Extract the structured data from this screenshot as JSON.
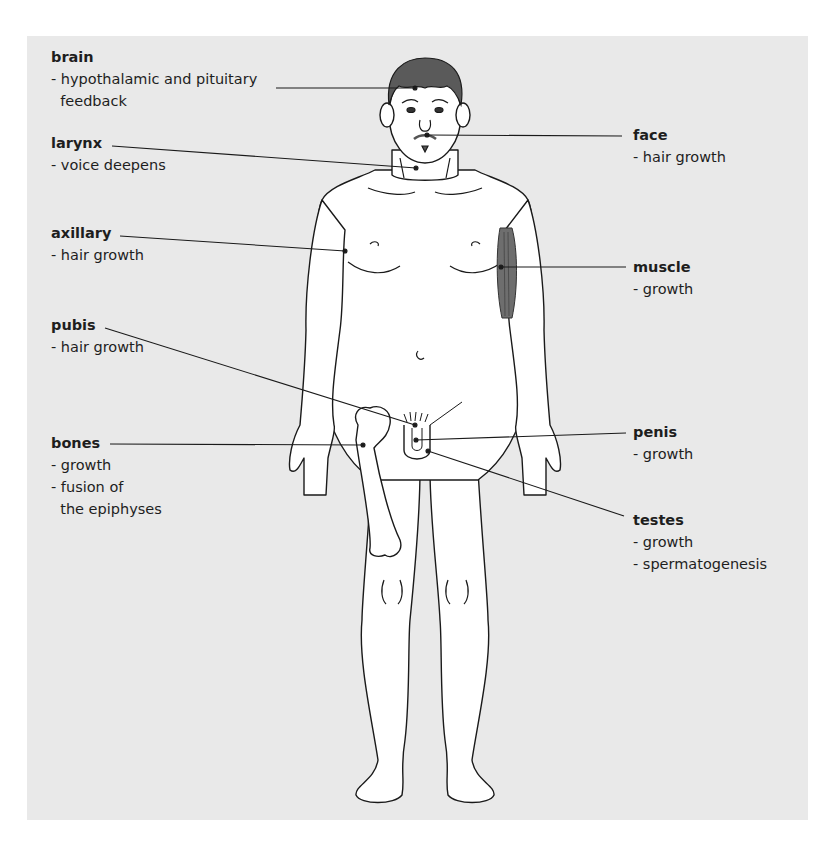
{
  "diagram": {
    "colors": {
      "background": "#e9e9e9",
      "figure_fill": "#ffffff",
      "outline": "#1a1a1a",
      "hair": "#5a5a5a",
      "muscle": "#6e6e6e"
    },
    "labels": [
      {
        "id": "brain",
        "title": "brain",
        "items": [
          "- hypothalamic and pituitary",
          "  feedback"
        ],
        "side": "left"
      },
      {
        "id": "larynx",
        "title": "larynx",
        "items": [
          "- voice deepens"
        ],
        "side": "left"
      },
      {
        "id": "axillary",
        "title": "axillary",
        "items": [
          "- hair growth"
        ],
        "side": "left"
      },
      {
        "id": "pubis",
        "title": "pubis",
        "items": [
          "- hair growth"
        ],
        "side": "left"
      },
      {
        "id": "bones",
        "title": "bones",
        "items": [
          "- growth",
          "- fusion of",
          "  the epiphyses"
        ],
        "side": "left"
      },
      {
        "id": "face",
        "title": "face",
        "items": [
          "- hair growth"
        ],
        "side": "right"
      },
      {
        "id": "muscle",
        "title": "muscle",
        "items": [
          "- growth"
        ],
        "side": "right"
      },
      {
        "id": "penis",
        "title": "penis",
        "items": [
          "- growth"
        ],
        "side": "right"
      },
      {
        "id": "testes",
        "title": "testes",
        "items": [
          "- growth",
          "- spermatogenesis"
        ],
        "side": "right"
      }
    ]
  }
}
